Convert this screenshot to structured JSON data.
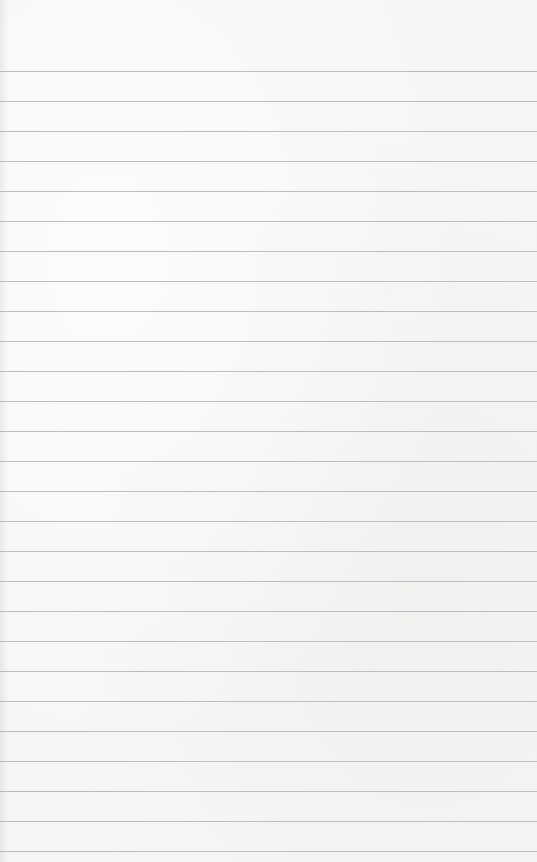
{
  "paper": {
    "type": "lined notepaper",
    "background_color": "#f6f6f4",
    "line_color": "#bdbdbb",
    "first_line_y": 71,
    "line_spacing": 30,
    "line_count": 27,
    "text": ""
  }
}
